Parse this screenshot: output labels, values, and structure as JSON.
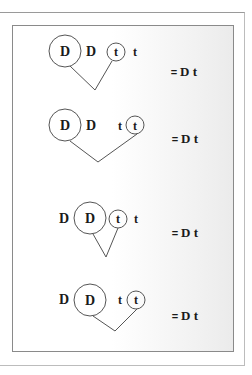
{
  "rows": [
    {
      "id": "row-1",
      "tokens": [
        {
          "label": "D",
          "circled": true,
          "size": "large"
        },
        {
          "label": "D",
          "circled": false
        },
        {
          "label": "t",
          "circled": true,
          "size": "small"
        },
        {
          "label": "t",
          "circled": false
        }
      ],
      "result": {
        "equals": "=",
        "text": "D t"
      }
    },
    {
      "id": "row-2",
      "tokens": [
        {
          "label": "D",
          "circled": true,
          "size": "large"
        },
        {
          "label": "D",
          "circled": false
        },
        {
          "label": "t",
          "circled": false
        },
        {
          "label": "t",
          "circled": true,
          "size": "small"
        }
      ],
      "result": {
        "equals": "=",
        "text": "D t"
      }
    },
    {
      "id": "row-3",
      "tokens": [
        {
          "label": "D",
          "circled": false
        },
        {
          "label": "D",
          "circled": true,
          "size": "large"
        },
        {
          "label": "t",
          "circled": true,
          "size": "small"
        },
        {
          "label": "t",
          "circled": false
        }
      ],
      "result": {
        "equals": "=",
        "text": "D t"
      }
    },
    {
      "id": "row-4",
      "tokens": [
        {
          "label": "D",
          "circled": false
        },
        {
          "label": "D",
          "circled": true,
          "size": "large"
        },
        {
          "label": "t",
          "circled": false
        },
        {
          "label": "t",
          "circled": true,
          "size": "small"
        }
      ],
      "result": {
        "equals": "=",
        "text": "D t"
      }
    }
  ],
  "colors": {
    "stroke": "#555555",
    "text": "#1a1a1a",
    "frame": "#8a8a8a"
  }
}
